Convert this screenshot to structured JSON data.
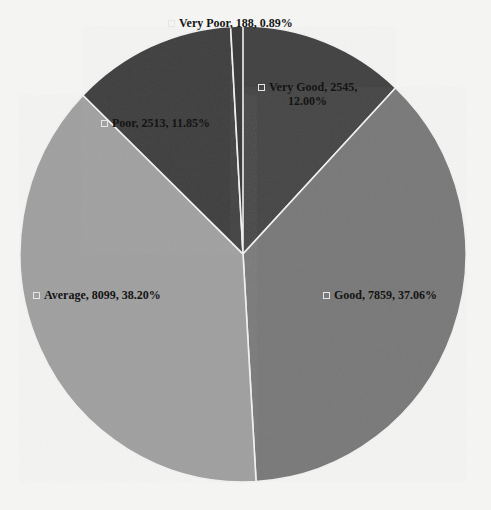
{
  "chart_data": {
    "type": "pie",
    "title": "",
    "start_angle_deg": 0,
    "direction": "clockwise",
    "slices": [
      {
        "name": "Very Good",
        "value": 2545,
        "percent": 12.0,
        "label": "Very Good, 2545,",
        "label_line2": "12.00%",
        "color": "#464646"
      },
      {
        "name": "Good",
        "value": 7859,
        "percent": 37.06,
        "label": "Good, 7859, 37.06%",
        "label_line2": "",
        "color": "#7c7c7c"
      },
      {
        "name": "Average",
        "value": 8099,
        "percent": 38.2,
        "label": "Average, 8099, 38.20%",
        "label_line2": "",
        "color": "#a2a2a2"
      },
      {
        "name": "Poor",
        "value": 2513,
        "percent": 11.85,
        "label": "Poor, 2513, 11.85%",
        "label_line2": "",
        "color": "#444444"
      },
      {
        "name": "Very Poor",
        "value": 188,
        "percent": 0.89,
        "label": "Very Poor, 188, 0.89%",
        "label_line2": "",
        "color": "#3e3e3e"
      }
    ],
    "legend": "inline data labels with category, value, percentage"
  },
  "layout": {
    "center_x": 243,
    "center_y": 254,
    "radius_x": 223,
    "radius_y": 228,
    "labels": [
      {
        "x": 258,
        "y": 80
      },
      {
        "x": 323,
        "y": 288
      },
      {
        "x": 33,
        "y": 288
      },
      {
        "x": 101,
        "y": 116
      },
      {
        "x": 168,
        "y": 16
      }
    ]
  }
}
